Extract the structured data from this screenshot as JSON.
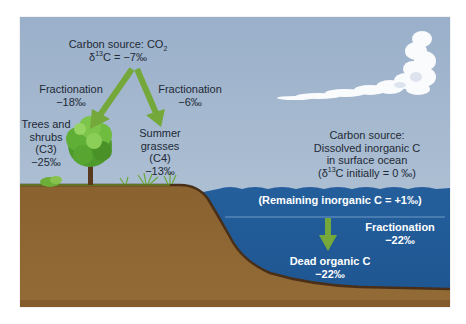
{
  "colors": {
    "sky": "#9db3cc",
    "ground": "#8f6733",
    "ground_edge": "#4a2f18",
    "ocean": "#1f5896",
    "arrow_green": "#74a83a",
    "tree_green": "#5fa532",
    "cloud": "#ffffff",
    "text_dark": "#1e2a36",
    "text_light": "#ffffff"
  },
  "atmosphere": {
    "source_label": "Carbon source:  CO",
    "source_sub": "2",
    "delta_prefix": "δ",
    "delta_sup": "13",
    "delta_value": "C = −7‰"
  },
  "left_fractionation": {
    "label": "Fractionation",
    "value": "−18‰"
  },
  "right_fractionation": {
    "label": "Fractionation",
    "value": "−6‰"
  },
  "c3_plants": {
    "line1": "Trees and",
    "line2": "shrubs",
    "line3": "(C3)",
    "value": "−25‰"
  },
  "c4_plants": {
    "line1": "Summer",
    "line2": "grasses",
    "line3": "(C4)",
    "value": "−13‰"
  },
  "ocean_source": {
    "line1": "Carbon source:",
    "line2": "Dissolved inorganic C",
    "line3": "in surface ocean",
    "line4_prefix": "(δ",
    "line4_sup": "13",
    "line4_rest": "C initially = 0 ‰)"
  },
  "remaining": {
    "label": "(Remaining inorganic C = +1‰)"
  },
  "ocean_fractionation": {
    "label": "Fractionation",
    "value": "−22‰"
  },
  "dead_organic": {
    "label": "Dead organic C",
    "value": "−22‰"
  }
}
